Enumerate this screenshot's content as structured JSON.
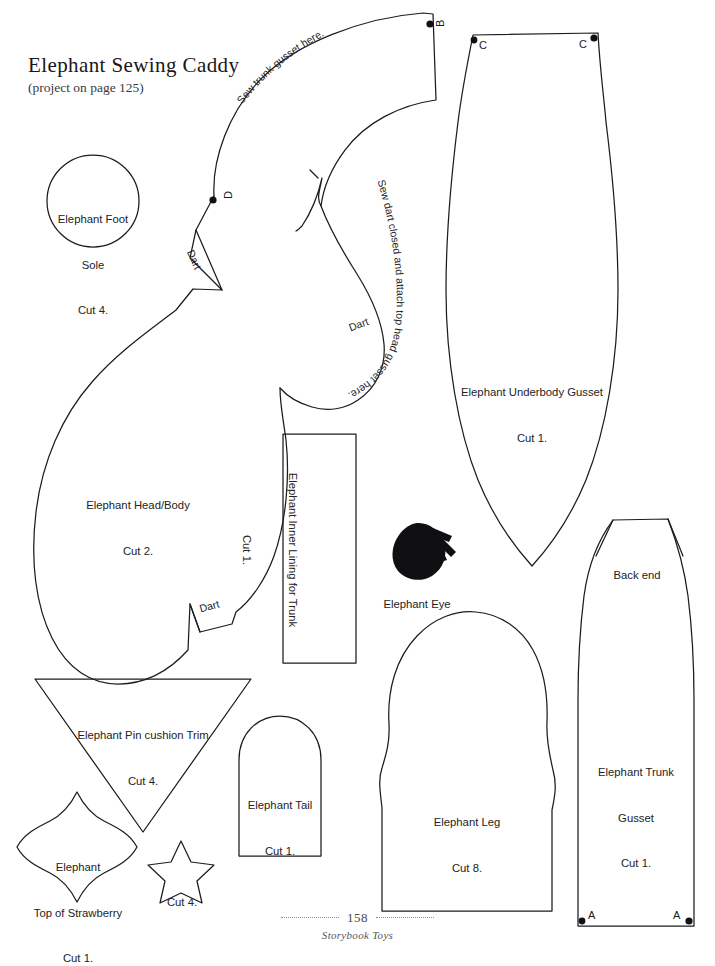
{
  "page": {
    "title": "Elephant Sewing Caddy",
    "subtitle": "(project on page 125)",
    "page_number": "158",
    "book_name": "Storybook Toys",
    "background_color": "#ffffff",
    "ink_color": "#1a1a1a"
  },
  "pieces": {
    "foot_sole": {
      "name": "Elephant Foot",
      "line2": "Sole",
      "cut": "Cut 4."
    },
    "head_body": {
      "name": "Elephant Head/Body",
      "cut": "Cut 2."
    },
    "underbody_gusset": {
      "name": "Elephant Underbody Gusset",
      "cut": "Cut 1."
    },
    "inner_lining": {
      "name": "Elephant Inner Lining for Trunk",
      "cut": "Cut 1."
    },
    "eye": {
      "name": "Elephant Eye"
    },
    "pin_cushion_trim": {
      "name": "Elephant Pin cushion Trim",
      "cut": "Cut 4."
    },
    "tail": {
      "name": "Elephant Tail",
      "cut": "Cut 1."
    },
    "leg": {
      "name": "Elephant Leg",
      "cut": "Cut 8."
    },
    "trunk_gusset": {
      "name": "Elephant Trunk",
      "line2": "Gusset",
      "cut": "Cut 1.",
      "back_end": "Back end"
    },
    "strawberry_top": {
      "name": "Elephant",
      "line2": "Top of Strawberry",
      "cut": "Cut 1."
    },
    "star": {
      "cut": "Cut 4."
    }
  },
  "instructions": {
    "trunk_gusset_note": "Sew trunk gusset here.",
    "head_gusset_note": "Sew dart closed and attach top head gusset here.",
    "dart_upper": "Dart",
    "dart_mid": "Dart",
    "dart_lower": "Dart"
  },
  "markers": {
    "b": "B",
    "c_left": "C",
    "c_right": "C",
    "d": "D",
    "a_left": "A",
    "a_right": "A"
  }
}
